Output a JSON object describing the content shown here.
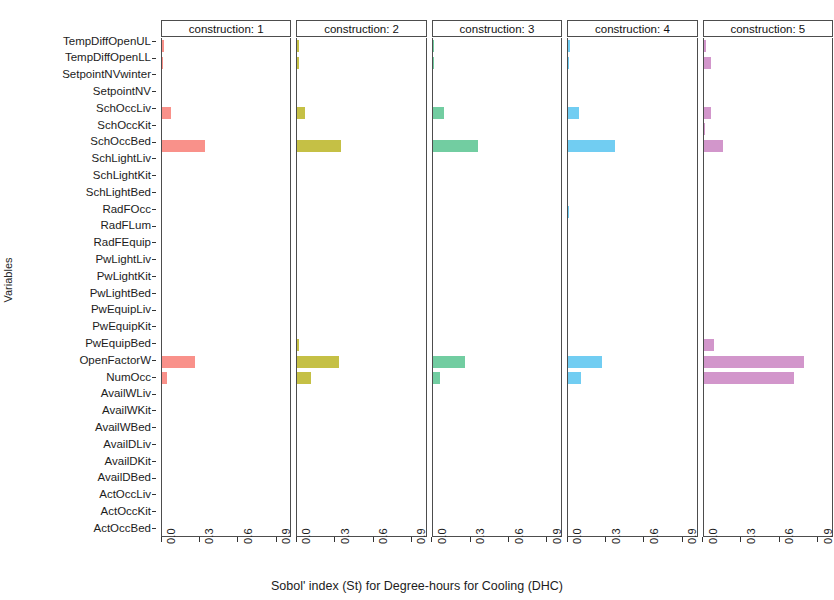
{
  "chart_data": {
    "type": "bar",
    "orientation": "horizontal",
    "title": "",
    "xlabel": "Sobol' index (St) for Degree-hours for Cooling (DHC)",
    "ylabel": "Variables",
    "xlim": [
      0,
      1.02
    ],
    "xticks": [
      0.0,
      0.3,
      0.6,
      0.9
    ],
    "xticklabels": [
      "0.0",
      "0.3",
      "0.6",
      "0.9"
    ],
    "grid": false,
    "legend": "none",
    "facet_var": "construction",
    "categories": [
      "TempDiffOpenUL",
      "TempDiffOpenLL",
      "SetpointNVwinter",
      "SetpointNV",
      "SchOccLiv",
      "SchOccKit",
      "SchOccBed",
      "SchLightLiv",
      "SchLightKit",
      "SchLightBed",
      "RadFOcc",
      "RadFLum",
      "RadFEquip",
      "PwLightLiv",
      "PwLightKit",
      "PwLightBed",
      "PwEquipLiv",
      "PwEquipKit",
      "PwEquipBed",
      "OpenFactorW",
      "NumOcc",
      "AvailWLiv",
      "AvailWKit",
      "AvailWBed",
      "AvailDLiv",
      "AvailDKit",
      "AvailDBed",
      "ActOccLiv",
      "ActOccKit",
      "ActOccBed"
    ],
    "series": [
      {
        "name": "construction: 1",
        "color": "#F8766D",
        "values": [
          0.012,
          0.01,
          0.0,
          0.0,
          0.075,
          0.0,
          0.34,
          0.0,
          0.0,
          0.0,
          0.0,
          0.0,
          0.0,
          0.0,
          0.0,
          0.0,
          0.0,
          0.0,
          0.0,
          0.265,
          0.04,
          0.0,
          0.0,
          0.0,
          0.0,
          0.0,
          0.0,
          0.0,
          0.0,
          0.0
        ]
      },
      {
        "name": "construction: 2",
        "color": "#B7B017",
        "values": [
          0.01,
          0.012,
          0.0,
          0.0,
          0.06,
          0.0,
          0.35,
          0.0,
          0.0,
          0.0,
          0.0,
          0.0,
          0.0,
          0.0,
          0.0,
          0.0,
          0.0,
          0.0,
          0.01,
          0.33,
          0.11,
          0.0,
          0.0,
          0.0,
          0.0,
          0.0,
          0.0,
          0.0,
          0.0,
          0.0
        ]
      },
      {
        "name": "construction: 3",
        "color": "#4FC08A",
        "values": [
          0.01,
          0.01,
          0.0,
          0.0,
          0.085,
          0.0,
          0.355,
          0.0,
          0.0,
          0.0,
          0.0,
          0.0,
          0.0,
          0.0,
          0.0,
          0.0,
          0.0,
          0.0,
          0.0,
          0.255,
          0.06,
          0.0,
          0.0,
          0.0,
          0.0,
          0.0,
          0.0,
          0.0,
          0.0,
          0.0
        ]
      },
      {
        "name": "construction: 4",
        "color": "#4DC0EF",
        "values": [
          0.012,
          0.01,
          0.0,
          0.0,
          0.085,
          0.0,
          0.375,
          0.0,
          0.0,
          0.0,
          0.01,
          0.0,
          0.0,
          0.0,
          0.0,
          0.0,
          0.0,
          0.0,
          0.0,
          0.27,
          0.105,
          0.0,
          0.0,
          0.0,
          0.0,
          0.0,
          0.0,
          0.0,
          0.0,
          0.0
        ]
      },
      {
        "name": "construction: 5",
        "color": "#C77CBE",
        "values": [
          0.02,
          0.055,
          0.0,
          0.0,
          0.055,
          0.014,
          0.15,
          0.0,
          0.0,
          0.0,
          0.0,
          0.0,
          0.0,
          0.0,
          0.0,
          0.0,
          0.0,
          0.0,
          0.08,
          0.8,
          0.72,
          0.0,
          0.0,
          0.0,
          0.0,
          0.0,
          0.0,
          0.0,
          0.0,
          0.0
        ]
      }
    ]
  },
  "axis": {
    "ylabel": "Variables",
    "xlabel": "Sobol' index (St) for Degree-hours for Cooling (DHC)"
  },
  "panels": [
    {
      "strip_label": "construction: 1"
    },
    {
      "strip_label": "construction: 2"
    },
    {
      "strip_label": "construction: 3"
    },
    {
      "strip_label": "construction: 4"
    },
    {
      "strip_label": "construction: 5"
    }
  ]
}
